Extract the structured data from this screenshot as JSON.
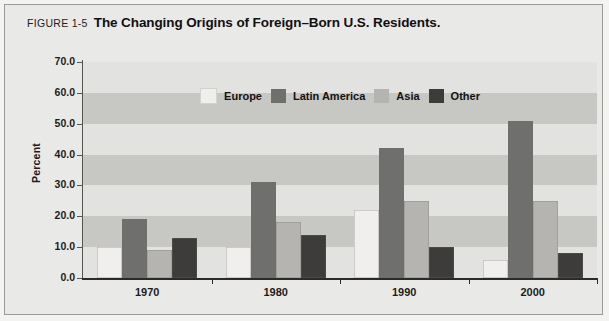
{
  "figure": {
    "number": "FIGURE 1-5",
    "title": "The Changing Origins of Foreign–Born U.S. Residents."
  },
  "chart_data": {
    "type": "bar",
    "title": "The Changing Origins of Foreign–Born U.S. Residents.",
    "xlabel": "",
    "ylabel": "Percent",
    "categories": [
      "1970",
      "1980",
      "1990",
      "2000"
    ],
    "ylim": [
      0,
      70
    ],
    "ytick_labels": [
      "0.0",
      "10.0",
      "20.0",
      "30.0",
      "40.0",
      "50.0",
      "60.0",
      "70.0"
    ],
    "ytick_values": [
      0,
      10,
      20,
      30,
      40,
      50,
      60,
      70
    ],
    "grid": false,
    "banded_background": true,
    "legend_position": "upper-center-inside",
    "series": [
      {
        "name": "Europe",
        "color": "#f0efed",
        "values": [
          10,
          10,
          22,
          6
        ]
      },
      {
        "name": "Latin America",
        "color": "#6f6f6d",
        "values": [
          19,
          31,
          42,
          51
        ]
      },
      {
        "name": "Asia",
        "color": "#b5b4b1",
        "values": [
          9,
          18,
          25,
          25
        ]
      },
      {
        "name": "Other",
        "color": "#3d3c3a",
        "values": [
          13,
          14,
          10,
          8
        ]
      }
    ]
  },
  "colors": {
    "panel_background": "#e9e9e8",
    "panel_border": "#9a9a98",
    "plot_band_light": "#e2e2e0",
    "plot_band_dark": "#c7c7c4",
    "axis": "#2b2a28",
    "text": "#1d1c1a"
  }
}
